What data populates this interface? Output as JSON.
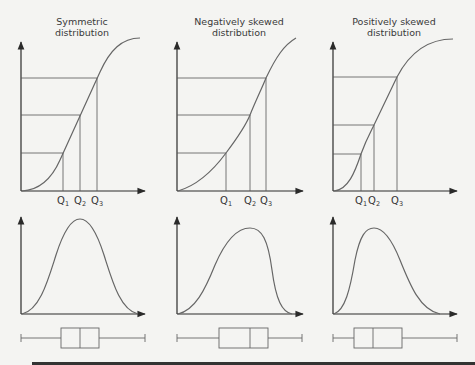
{
  "panels": [
    {
      "title_line1": "Symmetric",
      "title_line2": "distribution",
      "quartile_labels": [
        "Q",
        "Q",
        "Q"
      ],
      "quartile_subs": [
        "1",
        "2",
        "3"
      ]
    },
    {
      "title_line1": "Negatively skewed",
      "title_line2": "distribution",
      "quartile_labels": [
        "Q",
        "Q",
        "Q"
      ],
      "quartile_subs": [
        "1",
        "2",
        "3"
      ]
    },
    {
      "title_line1": "Positively skewed",
      "title_line2": "distribution",
      "quartile_labels": [
        "Q",
        "Q",
        "Q"
      ],
      "quartile_subs": [
        "1",
        "2",
        "3"
      ]
    }
  ],
  "colors": {
    "background": "#f4f4f2",
    "axis": "#2a2a2a",
    "curve": "#666666",
    "footer_bar": "#333333"
  }
}
